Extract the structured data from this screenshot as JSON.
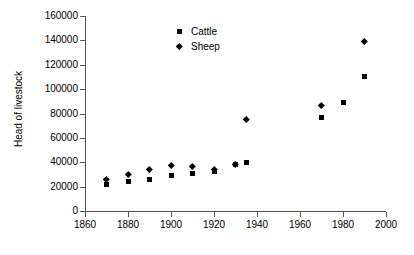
{
  "chart_data": {
    "type": "scatter",
    "title": "",
    "xlabel": "",
    "ylabel": "Head of livestock",
    "xlim": [
      1860,
      2000
    ],
    "ylim": [
      0,
      160000
    ],
    "grid": false,
    "legend_position": "top-center",
    "x_ticks": [
      1860,
      1880,
      1900,
      1920,
      1940,
      1960,
      1980,
      2000
    ],
    "y_ticks": [
      0,
      20000,
      40000,
      60000,
      80000,
      100000,
      120000,
      140000,
      160000
    ],
    "series": [
      {
        "name": "Cattle",
        "marker": "square",
        "color": "#000000",
        "x": [
          1870,
          1880,
          1890,
          1900,
          1910,
          1920,
          1930,
          1935,
          1970,
          1980,
          1990
        ],
        "values": [
          22000,
          24000,
          26000,
          29000,
          31000,
          32500,
          38000,
          40000,
          76500,
          89000,
          110500
        ]
      },
      {
        "name": "Sheep",
        "marker": "diamond",
        "color": "#000000",
        "x": [
          1870,
          1880,
          1890,
          1900,
          1910,
          1920,
          1930,
          1935,
          1970,
          1990
        ],
        "values": [
          26000,
          30000,
          34000,
          37500,
          37000,
          34000,
          38500,
          75500,
          87000,
          139500
        ]
      }
    ]
  },
  "axis": {
    "y_tick_labels": [
      "0",
      "20000",
      "40000",
      "60000",
      "80000",
      "100000",
      "120000",
      "140000",
      "160000"
    ],
    "x_tick_labels": [
      "1860",
      "1880",
      "1900",
      "1920",
      "1940",
      "1960",
      "1980",
      "2000"
    ],
    "y_title": "Head of livestock"
  },
  "legend": {
    "items": [
      {
        "label": "Cattle",
        "marker": "square"
      },
      {
        "label": "Sheep",
        "marker": "diamond"
      }
    ]
  }
}
